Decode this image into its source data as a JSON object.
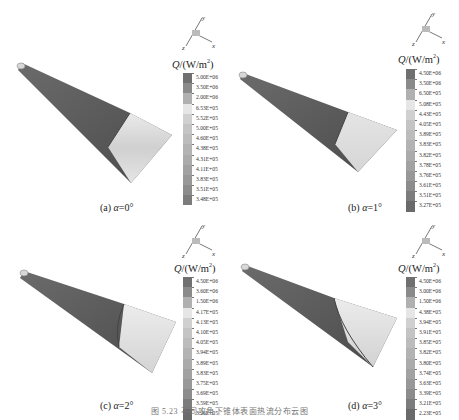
{
  "figure": {
    "caption": "图 5.23  不同攻角下锥体表面热流分布云图",
    "legend_title": "Q/(W/m²)",
    "legend_title_parts": {
      "q": "Q",
      "unit": "/(W/m",
      "sup": "2",
      "close": ")"
    },
    "axis_labels": {
      "x": "x",
      "y": "y",
      "z": "z"
    }
  },
  "panels": [
    {
      "id": "a",
      "caption_prefix": "(a) ",
      "alpha_symbol": "α",
      "alpha_value": "=0°",
      "legend_values": [
        "5.00E+06",
        "3.50E+06",
        "2.00E+06",
        "6.53E+05",
        "5.52E+05",
        "5.00E+05",
        "4.60E+05",
        "4.38E+05",
        "4.31E+05",
        "4.11E+05",
        "3.83E+05",
        "3.51E+05",
        "3.48E+05"
      ]
    },
    {
      "id": "b",
      "caption_prefix": "(b) ",
      "alpha_symbol": "α",
      "alpha_value": "=1°",
      "legend_values": [
        "4.50E+06",
        "3.50E+06",
        "6.50E+05",
        "5.08E+05",
        "4.43E+05",
        "4.05E+05",
        "3.89E+05",
        "3.83E+05",
        "3.82E+05",
        "3.78E+05",
        "3.76E+05",
        "3.61E+05",
        "3.51E+05",
        "3.27E+05"
      ]
    },
    {
      "id": "c",
      "caption_prefix": "(c) ",
      "alpha_symbol": "α",
      "alpha_value": "=2°",
      "legend_values": [
        "4.50E+06",
        "3.60E+06",
        "1.50E+06",
        "4.17E+05",
        "4.13E+05",
        "4.10E+05",
        "4.05E+05",
        "3.94E+05",
        "3.89E+05",
        "3.83E+05",
        "3.75E+05",
        "3.69E+05",
        "3.59E+05",
        "3.26E+05"
      ]
    },
    {
      "id": "d",
      "caption_prefix": "(d) ",
      "alpha_symbol": "α",
      "alpha_value": "=3°",
      "legend_values": [
        "4.50E+06",
        "3.00E+06",
        "1.50E+06",
        "4.38E+05",
        "3.94E+05",
        "3.91E+05",
        "3.85E+05",
        "3.82E+05",
        "3.80E+05",
        "3.74E+05",
        "3.63E+05",
        "3.39E+05",
        "3.21E+05",
        "2.23E+05"
      ]
    }
  ],
  "colors": {
    "cone_dark": "#5a5a5a",
    "cone_light": "#d9d9d9",
    "legend_top": "#7a7a7a",
    "legend_light": "#e8e8e8",
    "legend_bottom": "#666666"
  }
}
